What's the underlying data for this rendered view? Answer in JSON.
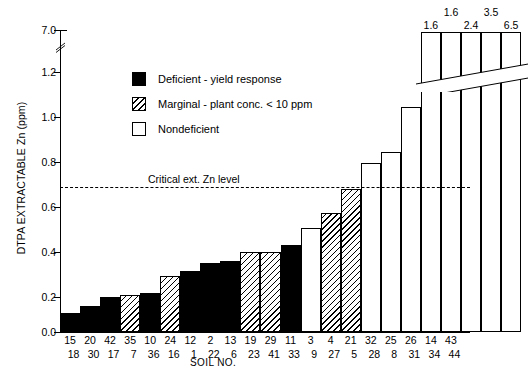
{
  "chart_data": {
    "type": "bar",
    "title": "",
    "xlabel": "SOIL NO.",
    "ylabel": "DTPA EXTRACTABLE Zn (ppm)",
    "ylim": [
      0.0,
      1.3
    ],
    "yticks": [
      "0.0",
      "0.2",
      "0.4",
      "0.6",
      "0.8",
      "1.0",
      "1.2",
      "7.0"
    ],
    "axis_break": true,
    "axis_break_between": [
      1.3,
      6.6
    ],
    "grid": false,
    "legend_position": "upper-center",
    "legend": [
      {
        "key": "deficient",
        "label": "Deficient - yield response"
      },
      {
        "key": "marginal",
        "label": "Marginal - plant conc. < 10 ppm"
      },
      {
        "key": "nondeficient",
        "label": "Nondeficient"
      }
    ],
    "annotations": [
      {
        "name": "critical-zn-level",
        "label": "Critical ext. Zn level",
        "value": 0.67,
        "style": "dashed-horizontal"
      }
    ],
    "categories": [
      "15/18",
      "20/30",
      "42/17",
      "35/7",
      "10/36",
      "24/16",
      "12/1",
      "2/22",
      "13/6",
      "19/23",
      "29/41",
      "11/33",
      "3/9",
      "4/27",
      "21/5",
      "32/28",
      "25/8",
      "26/31",
      "14/34",
      "43/44"
    ],
    "soil_numbers_row1": [
      "15",
      "20",
      "42",
      "35",
      "10",
      "24",
      "12",
      "2",
      "13",
      "19",
      "29",
      "11",
      "3",
      "4",
      "21",
      "32",
      "25",
      "26",
      "14",
      "43"
    ],
    "soil_numbers_row2": [
      "18",
      "30",
      "17",
      "7",
      "36",
      "16",
      "1",
      "22",
      "6",
      "23",
      "41",
      "33",
      "9",
      "27",
      "5",
      "28",
      "8",
      "31",
      "34",
      "44"
    ],
    "values": [
      0.09,
      0.12,
      0.16,
      0.17,
      0.18,
      0.26,
      0.28,
      0.32,
      0.33,
      0.37,
      0.37,
      0.4,
      0.48,
      0.55,
      0.66,
      0.78,
      0.83,
      1.04,
      1.6,
      1.6
    ],
    "class": [
      "deficient",
      "deficient",
      "deficient",
      "marginal",
      "deficient",
      "marginal",
      "deficient",
      "deficient",
      "deficient",
      "marginal",
      "marginal",
      "deficient",
      "nondeficient",
      "marginal",
      "marginal",
      "nondeficient",
      "nondeficient",
      "nondeficient",
      "nondeficient",
      "nondeficient"
    ],
    "overflow_bars": {
      "note": "Five rightmost bars exceed the axis break; values printed above the bars",
      "labels_upper_row": [
        "1.6",
        "3.5"
      ],
      "labels_lower_row": [
        "1.6",
        "2.4",
        "6.5"
      ],
      "values": [
        1.6,
        1.6,
        2.4,
        3.5,
        6.5
      ]
    }
  },
  "axis": {
    "y_title": "DTPA EXTRACTABLE Zn (ppm)",
    "x_title": "SOIL NO.",
    "y_ticks": [
      {
        "label": "7.0",
        "value": 7.0
      },
      {
        "label": "1.2",
        "value": 1.2
      },
      {
        "label": "1.0",
        "value": 1.0
      },
      {
        "label": "0.8",
        "value": 0.8
      },
      {
        "label": "0.6",
        "value": 0.6
      },
      {
        "label": "0.4",
        "value": 0.4
      },
      {
        "label": "0.2",
        "value": 0.2
      },
      {
        "label": "0.0",
        "value": 0.0
      }
    ]
  },
  "legend": {
    "deficient": "Deficient - yield response",
    "marginal": "Marginal - plant conc. < 10 ppm",
    "nondeficient": "Nondeficient"
  },
  "critical_line": {
    "text": "Critical ext. Zn level"
  },
  "top_labels": {
    "upper": [
      "1.6",
      "3.5"
    ],
    "lower": [
      "1.6",
      "2.4",
      "6.5"
    ]
  }
}
